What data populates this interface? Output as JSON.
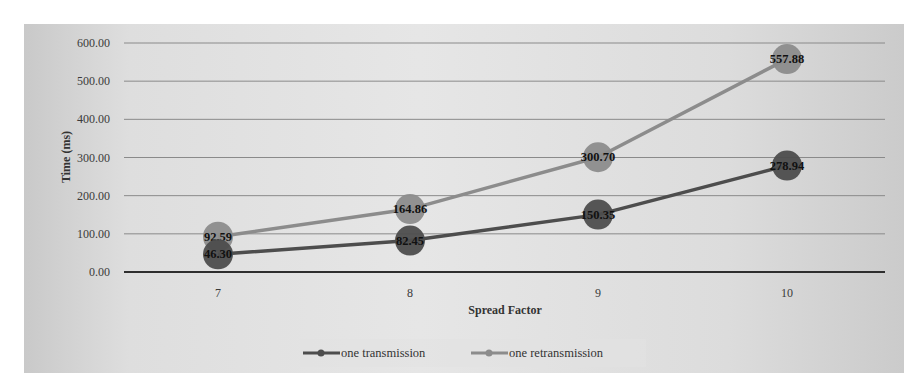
{
  "chart_data": {
    "type": "line",
    "title": "",
    "xlabel": "Spread Factor",
    "ylabel": "Time (ms)",
    "categories": [
      "7",
      "8",
      "9",
      "10"
    ],
    "y_ticks": [
      "0.00",
      "100.00",
      "200.00",
      "300.00",
      "400.00",
      "500.00",
      "600.00"
    ],
    "ylim": [
      0,
      600
    ],
    "grid": true,
    "legend_position": "bottom",
    "series": [
      {
        "name": "one transmission",
        "color": "#4d4d4d",
        "values": [
          46.3,
          82.45,
          150.35,
          278.94
        ],
        "labels": [
          "46.30",
          "82.45",
          "150.35",
          "278.94"
        ]
      },
      {
        "name": "one retransmission",
        "color": "#8c8c8c",
        "values": [
          92.59,
          164.86,
          300.7,
          557.88
        ],
        "labels": [
          "92.59",
          "164.86",
          "300.70",
          "557.88"
        ]
      }
    ]
  }
}
